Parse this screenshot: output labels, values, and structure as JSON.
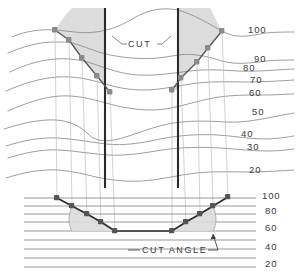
{
  "figure": {
    "type": "cross-section-contour-diagram",
    "background": "#ffffff",
    "ink": "#3a3a3a",
    "shade_fill": "#dcdcdc",
    "contour_color": "#8d8d8d",
    "marker_color": "#8a8a8a",
    "heavy_line_color": "#2b2b2b"
  },
  "annotations": {
    "cut_label": "CUT",
    "cut_angle_label": "CUT ANGLE"
  },
  "chart_data": {
    "type": "line",
    "title": "",
    "xlabel": "",
    "ylabel": "",
    "grid": true,
    "legend": null,
    "upper_contour_labels": [
      "100",
      "90",
      "80",
      "70",
      "60",
      "50",
      "40",
      "30",
      "20"
    ],
    "lower_scale_labels": [
      "100",
      "80",
      "60",
      "40",
      "20"
    ],
    "upper_label_positions": [
      {
        "text": "100",
        "x": 248,
        "y": 33
      },
      {
        "text": "90",
        "x": 254,
        "y": 62
      },
      {
        "text": "80",
        "x": 243,
        "y": 71
      },
      {
        "text": "70",
        "x": 250,
        "y": 83
      },
      {
        "text": "60",
        "x": 249,
        "y": 96
      },
      {
        "text": "50",
        "x": 252,
        "y": 115
      },
      {
        "text": "40",
        "x": 241,
        "y": 137
      },
      {
        "text": "30",
        "x": 247,
        "y": 150
      },
      {
        "text": "20",
        "x": 249,
        "y": 173
      }
    ],
    "lower_label_positions": [
      {
        "text": "100",
        "x": 262,
        "y": 199
      },
      {
        "text": "80",
        "x": 265,
        "y": 214
      },
      {
        "text": "60",
        "x": 265,
        "y": 231
      },
      {
        "text": "40",
        "x": 265,
        "y": 250
      },
      {
        "text": "20",
        "x": 265,
        "y": 267
      }
    ],
    "cut_walls": [
      {
        "name": "left-cut-wall",
        "x": 105,
        "y_top": 8,
        "y_bottom": 188
      },
      {
        "name": "right-cut-wall",
        "x": 178,
        "y_top": 8,
        "y_bottom": 188
      }
    ],
    "upper_left_slope_points": [
      {
        "x": 55,
        "y": 30
      },
      {
        "x": 69,
        "y": 40
      },
      {
        "x": 82,
        "y": 58
      },
      {
        "x": 97,
        "y": 76
      },
      {
        "x": 110,
        "y": 92
      }
    ],
    "upper_right_slope_points": [
      {
        "x": 172,
        "y": 90
      },
      {
        "x": 181,
        "y": 78
      },
      {
        "x": 197,
        "y": 62
      },
      {
        "x": 208,
        "y": 48
      },
      {
        "x": 222,
        "y": 31
      }
    ],
    "lower_profile_points": [
      {
        "x": 57,
        "y": 198
      },
      {
        "x": 72,
        "y": 206
      },
      {
        "x": 87,
        "y": 214
      },
      {
        "x": 101,
        "y": 222
      },
      {
        "x": 115,
        "y": 231
      },
      {
        "x": 172,
        "y": 231
      },
      {
        "x": 186,
        "y": 222
      },
      {
        "x": 200,
        "y": 214
      },
      {
        "x": 213,
        "y": 206
      },
      {
        "x": 228,
        "y": 197
      }
    ],
    "contour_lines_count": 9,
    "lower_scale_lines_count": 9
  }
}
